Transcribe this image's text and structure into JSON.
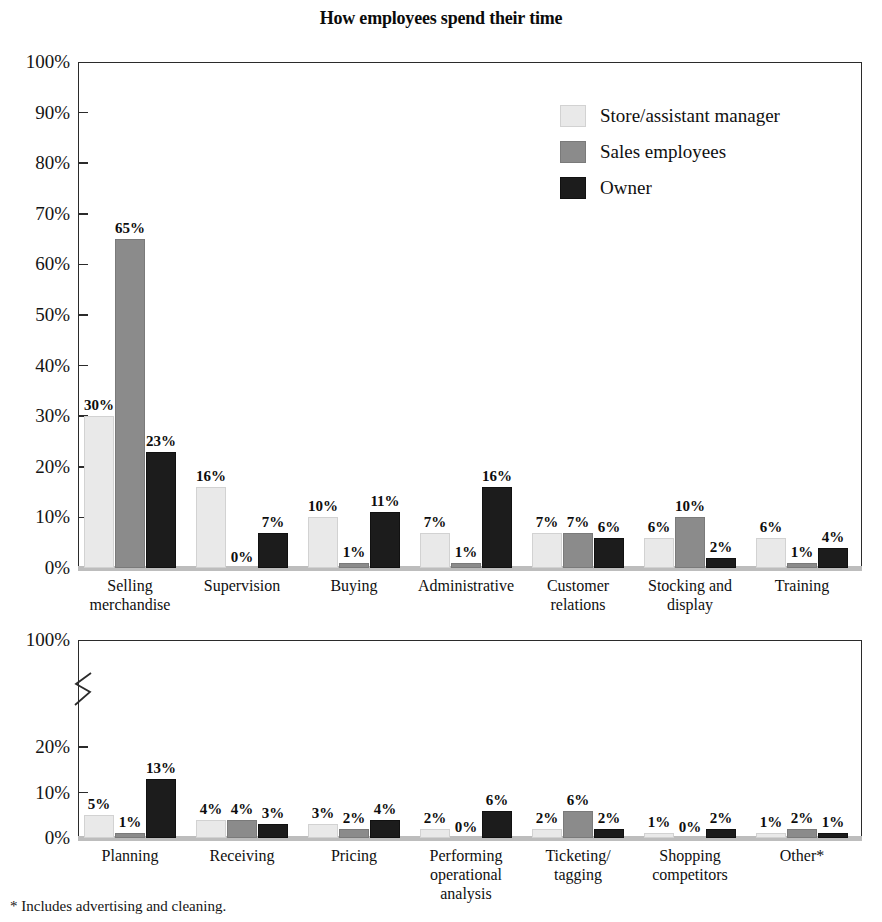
{
  "chart_data": [
    {
      "type": "bar",
      "id": "top-panel",
      "title": "How employees spend their time",
      "xlabel": "",
      "ylabel": "",
      "ylim": [
        0,
        100
      ],
      "ytick_labels": [
        "0%",
        "10%",
        "20%",
        "30%",
        "40%",
        "50%",
        "60%",
        "70%",
        "80%",
        "90%",
        "100%"
      ],
      "yticks": [
        0,
        10,
        20,
        30,
        40,
        50,
        60,
        70,
        80,
        90,
        100
      ],
      "grid": false,
      "legend_position": "upper right",
      "categories": [
        "Selling\nmerchandise",
        "Supervision",
        "Buying",
        "Administrative",
        "Customer\nrelations",
        "Stocking and\ndisplay",
        "Training"
      ],
      "series": [
        {
          "name": "Store/assistant manager",
          "color": "#e9e9e9",
          "values": [
            30,
            16,
            10,
            7,
            7,
            6,
            6
          ],
          "labels": [
            "30%",
            "16%",
            "10%",
            "7%",
            "7%",
            "6%",
            "6%"
          ]
        },
        {
          "name": "Sales employees",
          "color": "#8b8b8b",
          "values": [
            65,
            0,
            1,
            1,
            7,
            10,
            1
          ],
          "labels": [
            "65%",
            "0%",
            "1%",
            "1%",
            "7%",
            "10%",
            "1%"
          ]
        },
        {
          "name": "Owner",
          "color": "#1c1c1c",
          "values": [
            23,
            7,
            11,
            16,
            6,
            2,
            4
          ],
          "labels": [
            "23%",
            "7%",
            "11%",
            "16%",
            "6%",
            "2%",
            "4%"
          ]
        }
      ]
    },
    {
      "type": "bar",
      "id": "bottom-panel",
      "title": "",
      "xlabel": "",
      "ylabel": "",
      "ylim": [
        0,
        100
      ],
      "axis_break": true,
      "ytick_labels": [
        "0%",
        "10%",
        "20%",
        "100%"
      ],
      "yticks": [
        0,
        10,
        20,
        100
      ],
      "grid": false,
      "categories": [
        "Planning",
        "Receiving",
        "Pricing",
        "Performing\noperational\nanalysis",
        "Ticketing/\ntagging",
        "Shopping\ncompetitors",
        "Other*"
      ],
      "series": [
        {
          "name": "Store/assistant manager",
          "color": "#e9e9e9",
          "values": [
            5,
            4,
            3,
            2,
            2,
            1,
            1
          ],
          "labels": [
            "5%",
            "4%",
            "3%",
            "2%",
            "2%",
            "1%",
            "1%"
          ]
        },
        {
          "name": "Sales employees",
          "color": "#8b8b8b",
          "values": [
            1,
            4,
            2,
            0,
            6,
            0,
            2
          ],
          "labels": [
            "1%",
            "4%",
            "2%",
            "0%",
            "6%",
            "0%",
            "2%"
          ]
        },
        {
          "name": "Owner",
          "color": "#1c1c1c",
          "values": [
            13,
            3,
            4,
            6,
            2,
            2,
            1
          ],
          "labels": [
            "13%",
            "3%",
            "4%",
            "6%",
            "2%",
            "2%",
            "1%"
          ]
        }
      ]
    }
  ],
  "legend": {
    "items": [
      {
        "label": "Store/assistant manager",
        "swatch": "light-gray-swatch"
      },
      {
        "label": "Sales employees",
        "swatch": "medium-gray-swatch"
      },
      {
        "label": "Owner",
        "swatch": "black-swatch"
      }
    ]
  },
  "footnote": "* Includes advertising and cleaning.",
  "colors": {
    "series_store_assistant_manager": "#e9e9e9",
    "series_sales_employees": "#8b8b8b",
    "series_owner": "#1c1c1c",
    "axis": "#2b2b2b",
    "text": "#111111",
    "background": "#ffffff"
  }
}
